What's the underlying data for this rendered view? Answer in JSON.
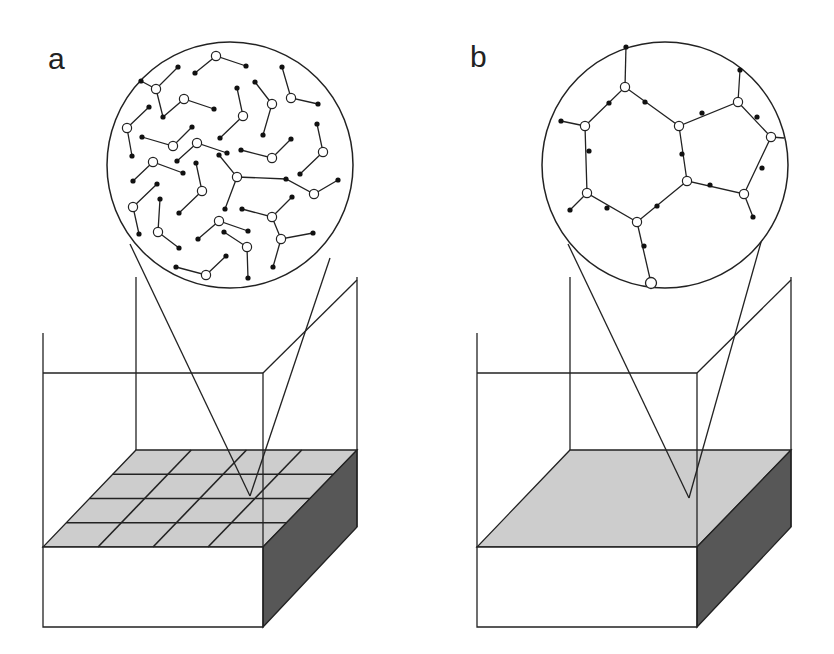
{
  "panels": [
    {
      "label": "a",
      "label_pos": [
        48,
        44
      ],
      "description": "Polymer network inside container with grid-divided gel surface; zoomed view shows disconnected branched molecules",
      "top_face_grid": {
        "rows": 4,
        "cols": 4
      },
      "zoom": {
        "center": [
          230,
          165
        ],
        "radius": 123,
        "nodes_open": [
          [
            216,
            56
          ],
          [
            156,
            89
          ],
          [
            184,
            99
          ],
          [
            127,
            128
          ],
          [
            173,
            146
          ],
          [
            243,
            116
          ],
          [
            272,
            104
          ],
          [
            291,
            98
          ],
          [
            197,
            143
          ],
          [
            272,
            158
          ],
          [
            323,
            152
          ],
          [
            153,
            162
          ],
          [
            237,
            177
          ],
          [
            314,
            194
          ],
          [
            202,
            191
          ],
          [
            133,
            207
          ],
          [
            158,
            232
          ],
          [
            219,
            221
          ],
          [
            247,
            247
          ],
          [
            272,
            217
          ],
          [
            281,
            239
          ],
          [
            206,
            275
          ]
        ],
        "bonds": [
          [
            [
              195,
              73
            ],
            [
              216,
              56
            ],
            [
              246,
              66
            ]
          ],
          [
            [
              141,
              81
            ],
            [
              156,
              89
            ],
            [
              178,
              67
            ]
          ],
          [
            [
              156,
              89
            ],
            [
              163,
              117
            ],
            [
              184,
              99
            ],
            [
              214,
              109
            ]
          ],
          [
            [
              149,
              107
            ],
            [
              127,
              128
            ],
            [
              132,
              156
            ]
          ],
          [
            [
              142,
              137
            ],
            [
              173,
              146
            ],
            [
              192,
              127
            ]
          ],
          [
            [
              237,
              88
            ],
            [
              243,
              116
            ],
            [
              220,
              138
            ]
          ],
          [
            [
              255,
              82
            ],
            [
              272,
              104
            ],
            [
              263,
              135
            ]
          ],
          [
            [
              282,
              67
            ],
            [
              291,
              98
            ],
            [
              318,
              104
            ]
          ],
          [
            [
              177,
              161
            ],
            [
              197,
              143
            ],
            [
              227,
              153
            ]
          ],
          [
            [
              241,
              150
            ],
            [
              272,
              158
            ],
            [
              291,
              139
            ]
          ],
          [
            [
              317,
              124
            ],
            [
              323,
              152
            ],
            [
              300,
              174
            ]
          ],
          [
            [
              133,
              181
            ],
            [
              153,
              162
            ],
            [
              183,
              173
            ]
          ],
          [
            [
              219,
              155
            ],
            [
              237,
              177
            ],
            [
              225,
              209
            ]
          ],
          [
            [
              237,
              177
            ],
            [
              286,
              179
            ],
            [
              314,
              194
            ],
            [
              338,
              180
            ]
          ],
          [
            [
              196,
              163
            ],
            [
              202,
              191
            ],
            [
              179,
              213
            ]
          ],
          [
            [
              157,
              184
            ],
            [
              133,
              207
            ],
            [
              139,
              234
            ]
          ],
          [
            [
              160,
              199
            ],
            [
              158,
              232
            ],
            [
              179,
              248
            ]
          ],
          [
            [
              198,
              239
            ],
            [
              219,
              221
            ],
            [
              248,
              231
            ]
          ],
          [
            [
              224,
              232
            ],
            [
              247,
              247
            ],
            [
              248,
              278
            ]
          ],
          [
            [
              242,
              209
            ],
            [
              272,
              217
            ],
            [
              292,
              197
            ]
          ],
          [
            [
              272,
              217
            ],
            [
              281,
              239
            ],
            [
              313,
              233
            ]
          ],
          [
            [
              281,
              239
            ],
            [
              273,
              267
            ]
          ],
          [
            [
              176,
              267
            ],
            [
              206,
              275
            ],
            [
              226,
              256
            ]
          ]
        ],
        "end_dots": [
          [
            195,
            73
          ],
          [
            246,
            66
          ],
          [
            141,
            81
          ],
          [
            178,
            67
          ],
          [
            163,
            117
          ],
          [
            214,
            109
          ],
          [
            149,
            107
          ],
          [
            132,
            156
          ],
          [
            142,
            137
          ],
          [
            192,
            127
          ],
          [
            237,
            88
          ],
          [
            220,
            138
          ],
          [
            255,
            82
          ],
          [
            263,
            135
          ],
          [
            282,
            67
          ],
          [
            318,
            104
          ],
          [
            177,
            161
          ],
          [
            227,
            153
          ],
          [
            241,
            150
          ],
          [
            291,
            139
          ],
          [
            317,
            124
          ],
          [
            300,
            174
          ],
          [
            133,
            181
          ],
          [
            183,
            173
          ],
          [
            219,
            155
          ],
          [
            225,
            209
          ],
          [
            286,
            179
          ],
          [
            338,
            180
          ],
          [
            196,
            163
          ],
          [
            179,
            213
          ],
          [
            157,
            184
          ],
          [
            139,
            234
          ],
          [
            160,
            199
          ],
          [
            179,
            248
          ],
          [
            198,
            239
          ],
          [
            248,
            231
          ],
          [
            224,
            232
          ],
          [
            248,
            278
          ],
          [
            242,
            209
          ],
          [
            292,
            197
          ],
          [
            313,
            233
          ],
          [
            273,
            267
          ],
          [
            176,
            267
          ],
          [
            226,
            256
          ]
        ]
      },
      "cone": {
        "left": [
          130,
          244
        ],
        "right": [
          330,
          258
        ],
        "apex": [
          250,
          496
        ]
      }
    },
    {
      "label": "b",
      "label_pos": [
        470,
        42
      ],
      "description": "Same container with continuous gel surface; zoomed view shows connected polymer network",
      "zoom": {
        "center": [
          665,
          165
        ],
        "radius": 123,
        "nodes_open": [
          [
            625,
            87
          ],
          [
            585,
            126
          ],
          [
            679,
            126
          ],
          [
            738,
            102
          ],
          [
            771,
            137
          ],
          [
            687,
            181
          ],
          [
            744,
            194
          ],
          [
            587,
            193
          ],
          [
            637,
            222
          ]
        ],
        "big_node": [
          651,
          283
        ],
        "bonds": [
          [
            [
              626,
              46
            ],
            [
              625,
              87
            ]
          ],
          [
            [
              561,
              121
            ],
            [
              585,
              126
            ]
          ],
          [
            [
              740,
              70
            ],
            [
              738,
              102
            ]
          ],
          [
            [
              771,
              137
            ],
            [
              784,
              138
            ]
          ],
          [
            [
              753,
              217
            ],
            [
              744,
              194
            ]
          ],
          [
            [
              570,
              210
            ],
            [
              587,
              193
            ]
          ],
          [
            [
              585,
              126
            ],
            [
              625,
              87
            ],
            [
              679,
              126
            ],
            [
              738,
              102
            ],
            [
              771,
              137
            ],
            [
              744,
              194
            ],
            [
              687,
              181
            ],
            [
              679,
              126
            ]
          ],
          [
            [
              585,
              126
            ],
            [
              587,
              193
            ],
            [
              637,
              222
            ],
            [
              687,
              181
            ]
          ],
          [
            [
              637,
              222
            ],
            [
              651,
              283
            ]
          ]
        ],
        "dots": [
          [
            626,
            47
          ],
          [
            561,
            121
          ],
          [
            740,
            70
          ],
          [
            753,
            217
          ],
          [
            570,
            210
          ],
          [
            609,
            103
          ],
          [
            645,
            102
          ],
          [
            702,
            113
          ],
          [
            757,
            117
          ],
          [
            589,
            151
          ],
          [
            682,
            154
          ],
          [
            710,
            185
          ],
          [
            762,
            168
          ],
          [
            607,
            208
          ],
          [
            657,
            206
          ],
          [
            644,
            246
          ]
        ]
      },
      "cone": {
        "left": [
          568,
          244
        ],
        "right": [
          765,
          228
        ],
        "apex": [
          689,
          498
        ]
      }
    }
  ],
  "colors": {
    "line": "#222222",
    "top_face": "#cdcdcd",
    "side_face": "#575757",
    "background": "#ffffff"
  }
}
